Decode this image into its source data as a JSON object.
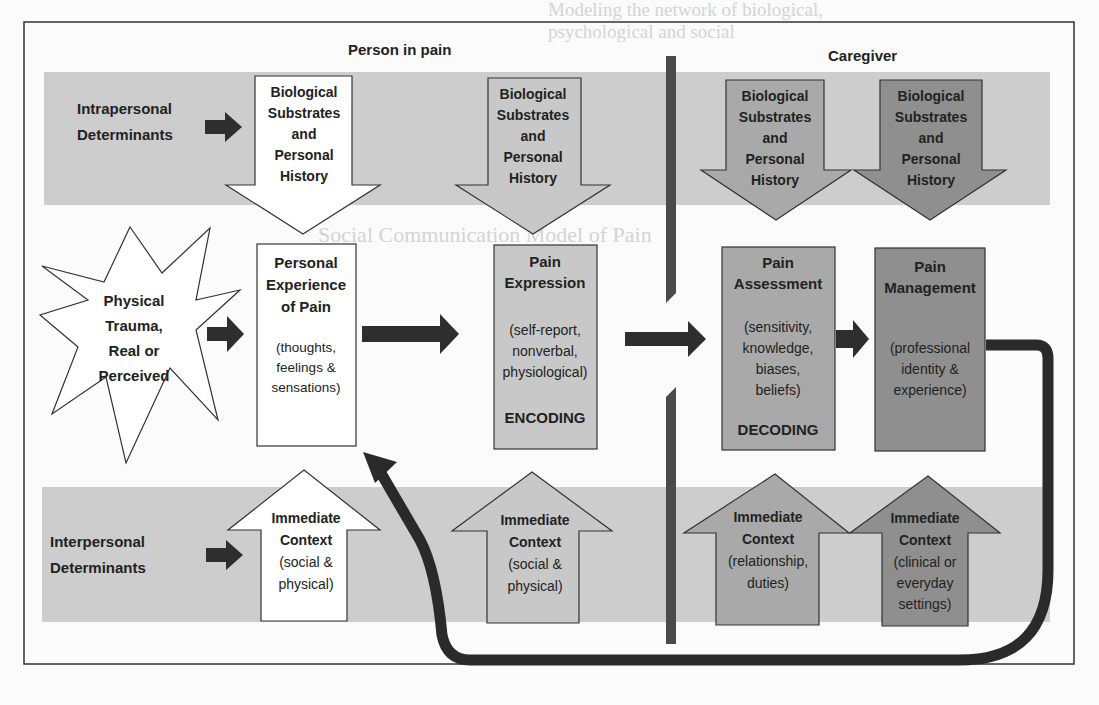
{
  "figure": {
    "title_left": "Person in pain",
    "title_right": "Caregiver",
    "colors": {
      "band": "#cfcfcf",
      "band_light": "#d9d9d9",
      "white_box": "#ffffff",
      "person_grey": "#c4c4c4",
      "assess_grey": "#a9a9a9",
      "manage_grey": "#8f8f8f",
      "dark": "#2e2e2e",
      "divider": "#4a4a4a"
    }
  },
  "rows": {
    "intrapersonal": {
      "label_lines": [
        "Intrapersonal",
        "Determinants"
      ]
    },
    "interpersonal": {
      "label_lines": [
        "Interpersonal",
        "Determinants"
      ]
    }
  },
  "trigger": {
    "label_lines": [
      "Physical",
      "Trauma,",
      "Real or",
      "Perceived"
    ]
  },
  "down_arrows": [
    {
      "id": "person-biological-1",
      "lines": [
        "Biological",
        "Substrates",
        "and",
        "Personal",
        "History"
      ]
    },
    {
      "id": "person-biological-2",
      "lines": [
        "Biological",
        "Substrates",
        "and",
        "Personal",
        "History"
      ]
    },
    {
      "id": "caregiver-biological-1",
      "lines": [
        "Biological",
        "Substrates",
        "and",
        "Personal",
        "History"
      ]
    },
    {
      "id": "caregiver-biological-2",
      "lines": [
        "Biological",
        "Substrates",
        "and",
        "Personal",
        "History"
      ]
    }
  ],
  "boxes": [
    {
      "id": "personal-experience",
      "title": [
        "Personal",
        "Experience",
        "of Pain"
      ],
      "detail": [
        "(thoughts,",
        "feelings &",
        "sensations)"
      ],
      "footer": ""
    },
    {
      "id": "pain-expression",
      "title": [
        "Pain",
        "Expression"
      ],
      "detail": [
        "(self-report,",
        "nonverbal,",
        "physiological)"
      ],
      "footer": "ENCODING"
    },
    {
      "id": "pain-assessment",
      "title": [
        "Pain",
        "Assessment"
      ],
      "detail": [
        "(sensitivity,",
        "knowledge,",
        "biases,",
        "beliefs)"
      ],
      "footer": "DECODING"
    },
    {
      "id": "pain-management",
      "title": [
        "Pain",
        "Management"
      ],
      "detail": [
        "(professional",
        "identity &",
        "experience)"
      ],
      "footer": ""
    }
  ],
  "up_arrows": [
    {
      "id": "person-context-1",
      "title": [
        "Immediate",
        "Context"
      ],
      "detail": [
        "(social &",
        "physical)"
      ]
    },
    {
      "id": "person-context-2",
      "title": [
        "Immediate",
        "Context"
      ],
      "detail": [
        "(social &",
        "physical)"
      ]
    },
    {
      "id": "caregiver-context-1",
      "title": [
        "Immediate",
        "Context"
      ],
      "detail": [
        "(relationship,",
        "duties)"
      ]
    },
    {
      "id": "caregiver-context-2",
      "title": [
        "Immediate",
        "Context"
      ],
      "detail": [
        "(clinical or",
        "everyday",
        "settings)"
      ]
    }
  ],
  "background_text": {
    "top_heading": [
      "Modeling the network of biological,",
      "psychological and social"
    ],
    "mid_heading": "Social Communication Model of Pain"
  }
}
